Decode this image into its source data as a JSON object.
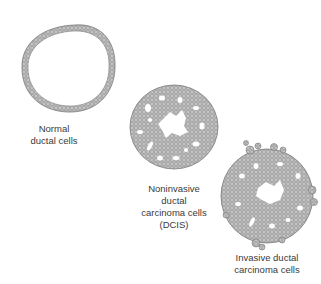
{
  "figure": {
    "stages": [
      {
        "id": "normal",
        "label_lines": [
          "Normal",
          "ductal cells"
        ]
      },
      {
        "id": "dcis",
        "label_lines": [
          "Noninvasive",
          "ductal",
          "carcinoma cells",
          "(DCIS)"
        ]
      },
      {
        "id": "invasive",
        "label_lines": [
          "Invasive ductal",
          "carcinoma cells"
        ]
      }
    ],
    "colors": {
      "background": "#ffffff",
      "cell_fill": "#bdbdbd",
      "cell_stroke": "#7a7a7a",
      "text": "#3a3a3a"
    }
  }
}
